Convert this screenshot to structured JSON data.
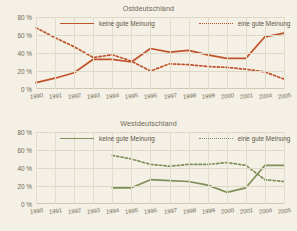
{
  "figure": {
    "background_color": "#f4f0e5",
    "panels": [
      "east",
      "west"
    ]
  },
  "chart_data": [
    {
      "type": "line",
      "title": "Ostdeutschland",
      "xlabel": "",
      "ylabel": "",
      "ylim": [
        0,
        80
      ],
      "yticks": [
        0,
        20,
        40,
        60,
        80
      ],
      "ytick_labels": [
        "0 %",
        "20 %",
        "40 %",
        "60 %",
        "80 %"
      ],
      "grid": true,
      "legend_position": "top",
      "color": "#c0532a",
      "x": [
        "1990",
        "1991",
        "1992",
        "1993",
        "1994",
        "1995",
        "1996",
        "1997",
        "1998",
        "1999",
        "2000",
        "2001",
        "2004",
        "2005"
      ],
      "series": [
        {
          "name": "keine gute Meinung",
          "style": "solid",
          "color": "#c0532a",
          "values": [
            7,
            12,
            18,
            33,
            33,
            30,
            45,
            41,
            43,
            38,
            34,
            34,
            58,
            62
          ]
        },
        {
          "name": "eine gute Meinung",
          "style": "dotted",
          "color": "#c0532a",
          "values": [
            68,
            57,
            47,
            35,
            38,
            31,
            20,
            28,
            27,
            25,
            24,
            22,
            19,
            11
          ]
        }
      ]
    },
    {
      "type": "line",
      "title": "Westdeutschland",
      "xlabel": "",
      "ylabel": "",
      "ylim": [
        0,
        80
      ],
      "yticks": [
        0,
        20,
        40,
        60,
        80
      ],
      "ytick_labels": [
        "0 %",
        "20 %",
        "40 %",
        "60 %",
        "80 %"
      ],
      "grid": true,
      "legend_position": "top",
      "color": "#7f8f5a",
      "x": [
        "1990",
        "1991",
        "1992",
        "1993",
        "1994",
        "1995",
        "1996",
        "1997",
        "1998",
        "1999",
        "2000",
        "2001",
        "2004",
        "2005"
      ],
      "series": [
        {
          "name": "keine gute Meinung",
          "style": "solid",
          "color": "#7f8f5a",
          "values": [
            null,
            null,
            null,
            null,
            18,
            18,
            27,
            26,
            25,
            21,
            13,
            18,
            43,
            43
          ]
        },
        {
          "name": "eine gute Meinung",
          "style": "dotted",
          "color": "#7f8f5a",
          "values": [
            null,
            null,
            null,
            null,
            54,
            50,
            44,
            42,
            44,
            44,
            46,
            43,
            27,
            25
          ]
        }
      ]
    }
  ],
  "east": {
    "title": "Ostdeutschland",
    "legend": {
      "solid_label": "keine gute Meinung",
      "dotted_label": "eine gute Meinung"
    },
    "ytick_labels": [
      "80 %",
      "60 %",
      "40 %",
      "20 %",
      "0 %"
    ],
    "xtick_labels": [
      "1990",
      "1991",
      "1992",
      "1993",
      "1994",
      "1995",
      "1996",
      "1997",
      "1998",
      "1999",
      "2000",
      "2001",
      "2004",
      "2005"
    ]
  },
  "west": {
    "title": "Westdeutschland",
    "legend": {
      "solid_label": "keine gute Meinung",
      "dotted_label": "eine gute Meinung"
    },
    "ytick_labels": [
      "80 %",
      "60 %",
      "40 %",
      "20 %",
      "0 %"
    ],
    "xtick_labels": [
      "1990",
      "1991",
      "1992",
      "1993",
      "1994",
      "1995",
      "1996",
      "1997",
      "1998",
      "1999",
      "2000",
      "2001",
      "2004",
      "2005"
    ]
  }
}
